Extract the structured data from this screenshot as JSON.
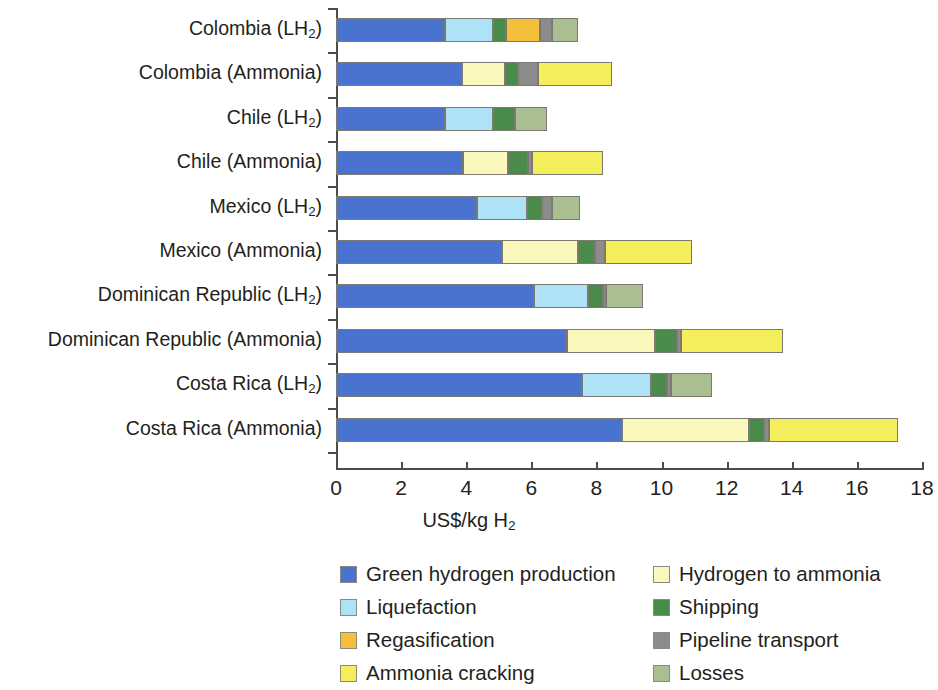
{
  "chart_data": {
    "type": "bar",
    "orientation": "horizontal",
    "stacked": true,
    "title": "",
    "xlabel": "US$/kg H2",
    "xlabel_parts": {
      "pre": "US$/kg H",
      "sub": "2"
    },
    "ylabel": "",
    "xlim": [
      0,
      18
    ],
    "xticks": [
      0,
      2,
      4,
      6,
      8,
      10,
      12,
      14,
      16,
      18
    ],
    "xtick_labels": [
      "0",
      "2",
      "4",
      "6",
      "8",
      "10",
      "12",
      "14",
      "16",
      "18"
    ],
    "grid": false,
    "legend_position": "bottom",
    "categories": [
      "Colombia (LH2)",
      "Colombia (Ammonia)",
      "Chile (LH2)",
      "Chile (Ammonia)",
      "Mexico (LH2)",
      "Mexico (Ammonia)",
      "Dominican Republic (LH2)",
      "Dominican Republic (Ammonia)",
      "Costa Rica (LH2)",
      "Costa Rica (Ammonia)"
    ],
    "category_labels": [
      {
        "main": "Colombia (LH",
        "sub": "2",
        "tail": ")"
      },
      {
        "main": "Colombia (Ammonia)",
        "sub": "",
        "tail": ""
      },
      {
        "main": "Chile (LH",
        "sub": "2",
        "tail": ")"
      },
      {
        "main": "Chile (Ammonia)",
        "sub": "",
        "tail": ""
      },
      {
        "main": "Mexico (LH",
        "sub": "2",
        "tail": ")"
      },
      {
        "main": "Mexico (Ammonia)",
        "sub": "",
        "tail": ""
      },
      {
        "main": "Dominican Republic (LH",
        "sub": "2",
        "tail": ")"
      },
      {
        "main": "Dominican Republic (Ammonia)",
        "sub": "",
        "tail": ""
      },
      {
        "main": "Costa Rica (LH",
        "sub": "2",
        "tail": ")"
      },
      {
        "main": "Costa Rica (Ammonia)",
        "sub": "",
        "tail": ""
      }
    ],
    "series": [
      {
        "name": "Green hydrogen production",
        "color": "#4a72cf",
        "values": [
          3.35,
          3.87,
          3.35,
          3.9,
          4.33,
          5.1,
          6.08,
          7.1,
          7.55,
          8.8
        ]
      },
      {
        "name": "Liquefaction",
        "color": "#aee3f7",
        "values": [
          1.47,
          0.0,
          1.47,
          0.0,
          1.54,
          0.0,
          1.66,
          0.0,
          2.12,
          0.0
        ]
      },
      {
        "name": "Hydrogen to ammonia",
        "color": "#fbf8bd",
        "values": [
          0.0,
          1.32,
          0.0,
          1.38,
          0.0,
          2.33,
          0.0,
          2.7,
          0.0,
          3.9
        ]
      },
      {
        "name": "Shipping",
        "color": "#4a8a4a",
        "values": [
          0.4,
          0.4,
          0.68,
          0.61,
          0.46,
          0.52,
          0.46,
          0.68,
          0.49,
          0.46
        ]
      },
      {
        "name": "Regasification",
        "color": "#f5bf3c",
        "values": [
          1.05,
          0.0,
          0.0,
          0.0,
          0.0,
          0.0,
          0.0,
          0.0,
          0.0,
          0.0
        ]
      },
      {
        "name": "Pipeline transport",
        "color": "#8c8c8c",
        "values": [
          0.37,
          0.61,
          0.0,
          0.12,
          0.31,
          0.31,
          0.09,
          0.12,
          0.12,
          0.15
        ]
      },
      {
        "name": "Ammonia cracking",
        "color": "#f4ee5c",
        "values": [
          0.0,
          2.27,
          0.0,
          2.18,
          0.0,
          2.67,
          0.0,
          3.13,
          0.0,
          3.95
        ]
      },
      {
        "name": "Losses",
        "color": "#a9bf92",
        "values": [
          0.8,
          0.0,
          0.98,
          0.0,
          0.86,
          0.0,
          1.14,
          0.0,
          1.26,
          0.0
        ]
      }
    ],
    "stack_order": [
      "Green hydrogen production",
      "Liquefaction",
      "Hydrogen to ammonia",
      "Shipping",
      "Regasification",
      "Pipeline transport",
      "Ammonia cracking",
      "Losses"
    ],
    "totals": [
      7.44,
      8.47,
      6.48,
      8.19,
      7.5,
      10.93,
      9.43,
      13.73,
      11.54,
      17.26
    ]
  },
  "legend": {
    "columns": [
      [
        {
          "label": "Green hydrogen production",
          "color": "#4a72cf",
          "key": "green-hydrogen-production"
        },
        {
          "label": "Liquefaction",
          "color": "#aee3f7",
          "key": "liquefaction"
        },
        {
          "label": "Regasification",
          "color": "#f5bf3c",
          "key": "regasification"
        },
        {
          "label": "Ammonia cracking",
          "color": "#f4ee5c",
          "key": "ammonia-cracking"
        }
      ],
      [
        {
          "label": "Hydrogen to ammonia",
          "color": "#fbf8bd",
          "key": "hydrogen-to-ammonia"
        },
        {
          "label": "Shipping",
          "color": "#4a8a4a",
          "key": "shipping"
        },
        {
          "label": "Pipeline transport",
          "color": "#8c8c8c",
          "key": "pipeline-transport"
        },
        {
          "label": "Losses",
          "color": "#a9bf92",
          "key": "losses"
        }
      ]
    ]
  },
  "colors": {
    "axis": "#4d4d4d",
    "text": "#231f20",
    "background": "#ffffff",
    "segment_border": "#7a7a70"
  }
}
